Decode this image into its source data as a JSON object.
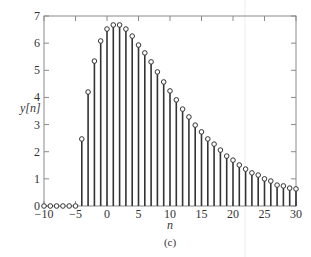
{
  "chart_data": {
    "type": "stem",
    "title": "",
    "caption": "(c)",
    "xlabel": "n",
    "ylabel": "y[n]",
    "xlim": [
      -10,
      30
    ],
    "ylim": [
      0,
      7
    ],
    "xticks": [
      -10,
      -5,
      0,
      5,
      10,
      15,
      20,
      25,
      30
    ],
    "yticks": [
      0,
      1,
      2,
      3,
      4,
      5,
      6,
      7
    ],
    "grid": false,
    "legend": null,
    "x": [
      -10,
      -9,
      -8,
      -7,
      -6,
      -5,
      -4,
      -3,
      -2,
      -1,
      0,
      1,
      2,
      3,
      4,
      5,
      6,
      7,
      8,
      9,
      10,
      11,
      12,
      13,
      14,
      15,
      16,
      17,
      18,
      19,
      20,
      21,
      22,
      23,
      24,
      25,
      26,
      27,
      28,
      29,
      30
    ],
    "values": [
      0,
      0,
      0,
      0,
      0,
      0,
      2.47,
      4.2,
      5.34,
      6.08,
      6.52,
      6.67,
      6.67,
      6.52,
      6.26,
      5.93,
      5.64,
      5.31,
      4.94,
      4.57,
      4.24,
      3.91,
      3.57,
      3.28,
      2.98,
      2.73,
      2.47,
      2.28,
      2.06,
      1.84,
      1.69,
      1.51,
      1.36,
      1.22,
      1.14,
      1.0,
      0.92,
      0.77,
      0.74,
      0.66,
      0.63
    ]
  },
  "colors": {
    "stem": "#333333",
    "axis": "#8a8a8a",
    "background": "#ffffff"
  }
}
